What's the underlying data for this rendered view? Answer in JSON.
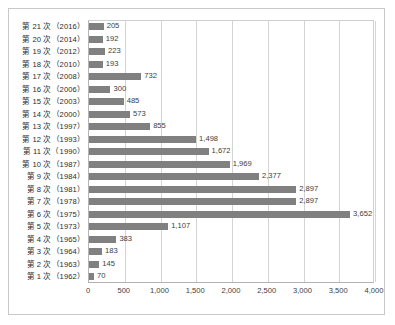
{
  "chart_data": {
    "type": "bar",
    "orientation": "horizontal",
    "title": "",
    "xlabel": "",
    "ylabel": "",
    "xlim": [
      0,
      4000
    ],
    "xticks": [
      "0",
      "500",
      "1,000",
      "1,500",
      "2,000",
      "2,500",
      "3,000",
      "3,500",
      "4,000"
    ],
    "xtick_values": [
      0,
      500,
      1000,
      1500,
      2000,
      2500,
      3000,
      3500,
      4000
    ],
    "grid": true,
    "legend": "none",
    "bar_color": "#808080",
    "categories": [
      "第 21 次（2016）",
      "第 20 次（2014）",
      "第 19 次（2012）",
      "第 18 次（2010）",
      "第 17 次（2008）",
      "第 16 次（2006）",
      "第 15 次（2003）",
      "第 14 次（2000）",
      "第 13 次（1997）",
      "第 12 次（1993）",
      "第 11 次（1990）",
      "第 10 次（1987）",
      "第 9 次（1984）",
      "第 8 次（1981）",
      "第 7 次（1978）",
      "第 6 次（1975）",
      "第 5 次（1973）",
      "第 4 次（1965）",
      "第 3 次（1964）",
      "第 2 次（1963）",
      "第 1 次（1962）"
    ],
    "values": [
      205,
      192,
      223,
      193,
      732,
      300,
      485,
      573,
      855,
      1498,
      1672,
      1969,
      2377,
      2897,
      2897,
      3652,
      1107,
      383,
      183,
      145,
      70
    ],
    "value_labels": [
      "205",
      "192",
      "223",
      "193",
      "732",
      "300",
      "485",
      "573",
      "855",
      "1,498",
      "1,672",
      "1,969",
      "2,377",
      "2,897",
      "2,897",
      "3,652",
      "1,107",
      "383",
      "183",
      "145",
      "70"
    ]
  }
}
